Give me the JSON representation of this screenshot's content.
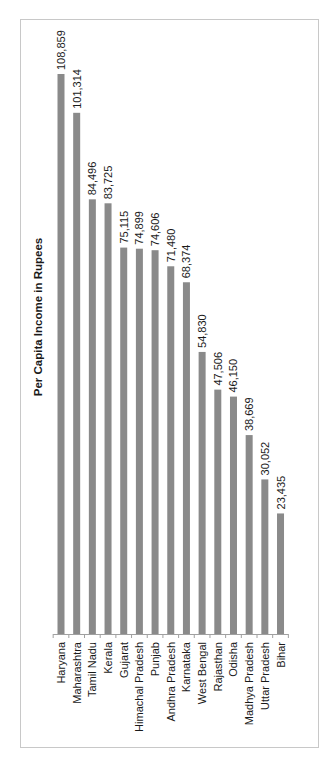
{
  "chart_data": {
    "type": "bar",
    "orientation": "vertical bars, figure rotated 90° counter-clockwise",
    "title": "Per Capita Income in Rupees",
    "xlabel": "",
    "ylabel": "",
    "categories": [
      "Haryana",
      "Maharashtra",
      "Tamil Nadu",
      "Kerala",
      "Gujarat",
      "Himachal Pradesh",
      "Punjab",
      "Andhra Pradesh",
      "Karnataka",
      "West Bengal",
      "Rajasthan",
      "Odisha",
      "Madhya Pradesh",
      "Uttar Pradesh",
      "Bihar"
    ],
    "values": [
      108859,
      101314,
      84496,
      83725,
      75115,
      74899,
      74606,
      71480,
      68374,
      54830,
      47506,
      46150,
      38669,
      30052,
      23435
    ],
    "value_labels": [
      "108,859",
      "101,314",
      "84,496",
      "83,725",
      "75,115",
      "74,899",
      "74,606",
      "71,480",
      "68,374",
      "54,830",
      "47,506",
      "46,150",
      "38,669",
      "30,052",
      "23,435"
    ],
    "ylim": [
      0,
      110000
    ],
    "grid": false,
    "legend": "none",
    "bar_color": "#8a8a8a"
  }
}
